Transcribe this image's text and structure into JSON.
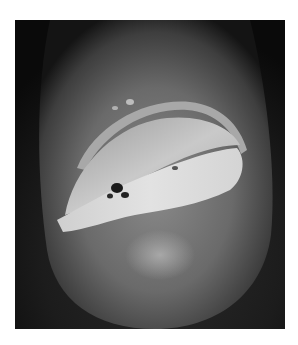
{
  "image": {
    "kind": "grayscale clinical photograph",
    "subject": "fingertip with nail plate lesion",
    "alt": "Grayscale close-up photograph of a fingertip showing a detached, crusted nail plate with an eroded lesion beneath",
    "colors": {
      "background": "#ffffff",
      "frame_dark": "#0d0d0d",
      "skin_mid": "#6e6e6e",
      "skin_light": "#9a9a9a",
      "nail": "#c8c8c8",
      "lesion_highlight": "#e6e6e6",
      "lesion_dark": "#1a1a1a"
    }
  }
}
